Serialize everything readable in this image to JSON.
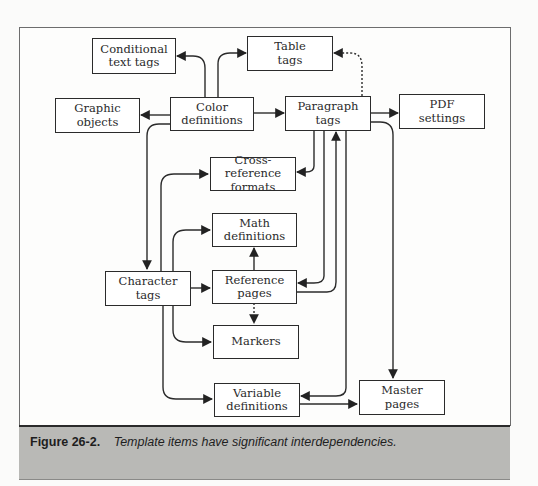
{
  "figure": {
    "caption_label": "Figure 26-2.",
    "caption_text": "Template items have significant interdependencies."
  },
  "nodes": {
    "conditional_text_tags": "Conditional\ntext tags",
    "table_tags": "Table\ntags",
    "graphic_objects": "Graphic\nobjects",
    "color_definitions": "Color\ndefinitions",
    "paragraph_tags": "Paragraph\ntags",
    "pdf_settings": "PDF\nsettings",
    "cross_reference_formats": "Cross-reference\nformats",
    "math_definitions": "Math\ndefinitions",
    "character_tags": "Character\ntags",
    "reference_pages": "Reference\npages",
    "markers": "Markers",
    "variable_definitions": "Variable\ndefinitions",
    "master_pages": "Master\npages"
  },
  "edges": [
    {
      "from": "Color definitions",
      "to": "Conditional text tags",
      "style": "solid"
    },
    {
      "from": "Color definitions",
      "to": "Table tags",
      "style": "solid"
    },
    {
      "from": "Color definitions",
      "to": "Graphic objects",
      "style": "solid"
    },
    {
      "from": "Color definitions",
      "to": "Paragraph tags",
      "style": "solid"
    },
    {
      "from": "Color definitions",
      "to": "Character tags",
      "style": "solid"
    },
    {
      "from": "Paragraph tags",
      "to": "Table tags",
      "style": "dotted"
    },
    {
      "from": "Paragraph tags",
      "to": "PDF settings",
      "style": "solid"
    },
    {
      "from": "Paragraph tags",
      "to": "Cross-reference formats",
      "style": "solid"
    },
    {
      "from": "Paragraph tags",
      "to": "Reference pages",
      "style": "solid"
    },
    {
      "from": "Reference pages",
      "to": "Paragraph tags",
      "style": "solid"
    },
    {
      "from": "Paragraph tags",
      "to": "Variable definitions",
      "style": "solid"
    },
    {
      "from": "Paragraph tags",
      "to": "Master pages",
      "style": "solid"
    },
    {
      "from": "Character tags",
      "to": "Cross-reference formats",
      "style": "solid"
    },
    {
      "from": "Character tags",
      "to": "Math definitions",
      "style": "solid"
    },
    {
      "from": "Character tags",
      "to": "Reference pages",
      "style": "solid"
    },
    {
      "from": "Character tags",
      "to": "Markers",
      "style": "solid"
    },
    {
      "from": "Character tags",
      "to": "Variable definitions",
      "style": "solid"
    },
    {
      "from": "Reference pages",
      "to": "Math definitions",
      "style": "solid"
    },
    {
      "from": "Reference pages",
      "to": "Markers",
      "style": "dotted"
    },
    {
      "from": "Variable definitions",
      "to": "Master pages",
      "style": "solid"
    }
  ]
}
